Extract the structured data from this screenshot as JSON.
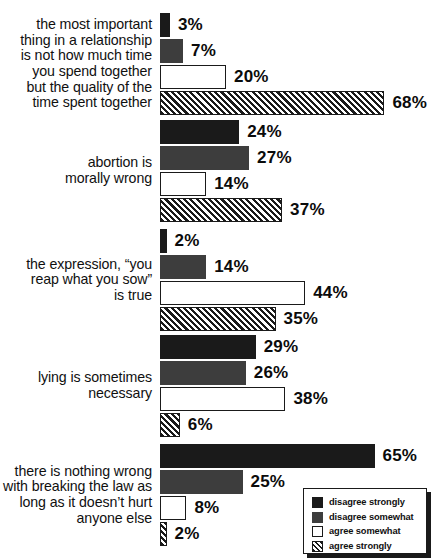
{
  "chart_data": {
    "type": "bar",
    "orientation": "horizontal",
    "title": "",
    "subtitle": "",
    "xlabel": "",
    "ylabel": "",
    "xlim": [
      0,
      68
    ],
    "grid": false,
    "value_suffix": "%",
    "legend_position": "bottom-right",
    "categories": [
      "the most important thing in a relationship is not how much time you spend together but the quality of the time spent together",
      "abortion is morally wrong",
      "the expression, “you reap what you sow” is true",
      "lying is sometimes necessary",
      "there is nothing wrong with breaking the law as long as it doesn’t hurt anyone else"
    ],
    "series": [
      {
        "name": "disagree strongly",
        "values": [
          3,
          24,
          2,
          29,
          65
        ]
      },
      {
        "name": "disagree somewhat",
        "values": [
          7,
          27,
          14,
          26,
          25
        ]
      },
      {
        "name": "agree somewhat",
        "values": [
          20,
          14,
          44,
          38,
          8
        ]
      },
      {
        "name": "agree strongly",
        "values": [
          68,
          37,
          35,
          6,
          2
        ]
      }
    ]
  },
  "groups": [
    {
      "label_lines": [
        "the most important",
        "thing in a relationship",
        "is not how much time",
        "you spend together",
        "but the quality of the",
        "time spent together"
      ],
      "bars": [
        {
          "series": "disagree strongly",
          "value": 3,
          "value_label": "3%"
        },
        {
          "series": "disagree somewhat",
          "value": 7,
          "value_label": "7%"
        },
        {
          "series": "agree somewhat",
          "value": 20,
          "value_label": "20%"
        },
        {
          "series": "agree strongly",
          "value": 68,
          "value_label": "68%"
        }
      ]
    },
    {
      "label_lines": [
        "abortion is",
        "morally wrong"
      ],
      "bars": [
        {
          "series": "disagree strongly",
          "value": 24,
          "value_label": "24%"
        },
        {
          "series": "disagree somewhat",
          "value": 27,
          "value_label": "27%"
        },
        {
          "series": "agree somewhat",
          "value": 14,
          "value_label": "14%"
        },
        {
          "series": "agree strongly",
          "value": 37,
          "value_label": "37%"
        }
      ]
    },
    {
      "label_lines": [
        "the expression, “you",
        "reap what you sow”",
        "is true"
      ],
      "bars": [
        {
          "series": "disagree strongly",
          "value": 2,
          "value_label": "2%"
        },
        {
          "series": "disagree somewhat",
          "value": 14,
          "value_label": "14%"
        },
        {
          "series": "agree somewhat",
          "value": 44,
          "value_label": "44%"
        },
        {
          "series": "agree strongly",
          "value": 35,
          "value_label": "35%"
        }
      ]
    },
    {
      "label_lines": [
        "lying is sometimes",
        "necessary"
      ],
      "bars": [
        {
          "series": "disagree strongly",
          "value": 29,
          "value_label": "29%"
        },
        {
          "series": "disagree somewhat",
          "value": 26,
          "value_label": "26%"
        },
        {
          "series": "agree somewhat",
          "value": 38,
          "value_label": "38%"
        },
        {
          "series": "agree strongly",
          "value": 6,
          "value_label": "6%"
        }
      ]
    },
    {
      "label_lines": [
        "there is nothing wrong",
        "with breaking the law as",
        "long as it doesn’t hurt",
        "anyone else"
      ],
      "bars": [
        {
          "series": "disagree strongly",
          "value": 65,
          "value_label": "65%"
        },
        {
          "series": "disagree somewhat",
          "value": 25,
          "value_label": "25%"
        },
        {
          "series": "agree somewhat",
          "value": 8,
          "value_label": "8%"
        },
        {
          "series": "agree strongly",
          "value": 2,
          "value_label": "2%"
        }
      ]
    }
  ],
  "legend": {
    "items": [
      {
        "label": "disagree strongly",
        "swatch": "solid-black",
        "color": "#1a1a1a"
      },
      {
        "label": "disagree somewhat",
        "swatch": "solid-gray",
        "color": "#3d3d3d"
      },
      {
        "label": "agree somewhat",
        "swatch": "outline-white",
        "color": "#ffffff"
      },
      {
        "label": "agree strongly",
        "swatch": "hatched",
        "color": "#1a1a1a"
      }
    ]
  },
  "style": {
    "background": "#ffffff",
    "text_color": "#101010",
    "px_per_percent": 3.3,
    "bar_origin_x": 160
  }
}
